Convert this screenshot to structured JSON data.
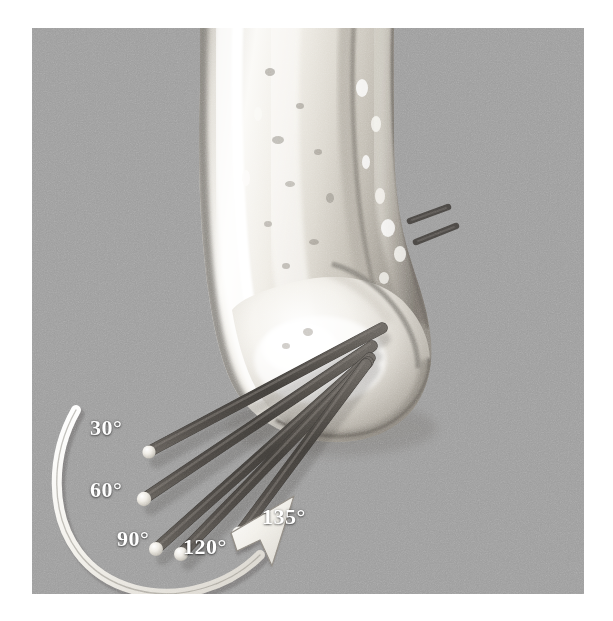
{
  "figure": {
    "caption_alt": "3D CT reconstruction of distal tibia and talus with five guide pins inserted at varying insertion angles",
    "background_color": "#9d9d9d",
    "bone_color": "#f2f0ec",
    "pin_color": "#4d4a47",
    "pin_tip_color": "#e8e6e0",
    "arrow_color": "#f0eee9",
    "label_color": "#ffffff"
  },
  "angle_labels": [
    {
      "id": "label-30",
      "text": "30°",
      "x": 58,
      "y": 389
    },
    {
      "id": "label-60",
      "text": "60°",
      "x": 58,
      "y": 451
    },
    {
      "id": "label-90",
      "text": "90°",
      "x": 85,
      "y": 500
    },
    {
      "id": "label-120",
      "text": "120°",
      "x": 151,
      "y": 508
    },
    {
      "id": "label-135",
      "text": "135°",
      "x": 230,
      "y": 478
    }
  ],
  "pins": [
    {
      "id": "pin-30",
      "angle": "30°",
      "tip_x": 118,
      "tip_y": 423,
      "head_x": 350,
      "head_y": 300
    },
    {
      "id": "pin-60",
      "angle": "60°",
      "tip_x": 113,
      "tip_y": 470,
      "head_x": 340,
      "head_y": 318
    },
    {
      "id": "pin-90",
      "angle": "90°",
      "tip_x": 125,
      "tip_y": 520,
      "head_x": 338,
      "head_y": 330
    },
    {
      "id": "pin-120",
      "angle": "120°",
      "tip_x": 150,
      "tip_y": 525,
      "head_x": 336,
      "head_y": 334
    },
    {
      "id": "pin-135",
      "angle": "135°",
      "tip_x": 208,
      "tip_y": 505,
      "head_x": 334,
      "head_y": 336
    }
  ],
  "arrow": {
    "id": "rotation-arrow",
    "description": "curved sweep arrow indicating increasing insertion angle",
    "direction": "clockwise-up-right",
    "start_angle": "30°",
    "end_angle": "135°"
  },
  "protruding_pins": [
    {
      "id": "protruding-pin-1"
    },
    {
      "id": "protruding-pin-2"
    }
  ]
}
